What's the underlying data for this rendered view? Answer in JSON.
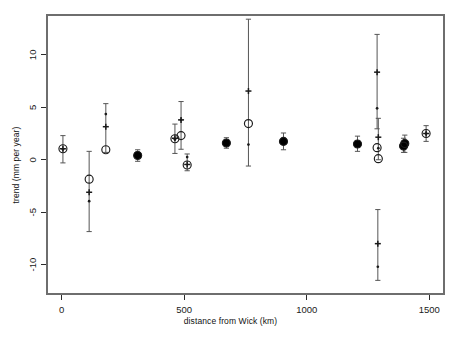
{
  "chart_data": {
    "type": "scatter",
    "title": "",
    "subtitle": "",
    "xlabel": "distance from Wick (km)",
    "ylabel": "trend (mm per year)",
    "xlim": [
      -60,
      1560
    ],
    "ylim": [
      -12.8,
      13.8
    ],
    "xticks": [
      0,
      500,
      1000,
      1500
    ],
    "xticklabels": [
      "0",
      "500",
      "1000",
      "1500"
    ],
    "yticks": [
      -10,
      -5,
      0,
      5,
      10
    ],
    "yticklabels": [
      "-10",
      "-5",
      "0",
      "5",
      "10"
    ],
    "grid": false,
    "legend": false,
    "legend_position": "none",
    "box": true,
    "colors": {
      "foreground": "#1a1a1a",
      "frame": "#6e6e6e",
      "open_circle": "#1a1a1a",
      "filled_circle": "#000000",
      "error_bar": "#555555"
    },
    "series": [
      {
        "name": "open-circle",
        "marker": "open-circle",
        "points": [
          {
            "x": 5,
            "y": 1.05
          },
          {
            "x": 112,
            "y": -1.85
          },
          {
            "x": 180,
            "y": 0.95
          },
          {
            "x": 310,
            "y": 0.4
          },
          {
            "x": 462,
            "y": 2.0
          },
          {
            "x": 487,
            "y": 2.3
          },
          {
            "x": 512,
            "y": -0.5
          },
          {
            "x": 672,
            "y": 1.6
          },
          {
            "x": 762,
            "y": 3.45
          },
          {
            "x": 905,
            "y": 1.75
          },
          {
            "x": 1207,
            "y": 1.5
          },
          {
            "x": 1287,
            "y": 1.15
          },
          {
            "x": 1292,
            "y": 0.1
          },
          {
            "x": 1395,
            "y": 1.3
          },
          {
            "x": 1400,
            "y": 1.55
          },
          {
            "x": 1487,
            "y": 2.5
          }
        ]
      },
      {
        "name": "cross",
        "marker": "plus",
        "points": [
          {
            "x": 5,
            "y": 1.05
          },
          {
            "x": 112,
            "y": -3.1
          },
          {
            "x": 180,
            "y": 3.15
          },
          {
            "x": 310,
            "y": 0.45
          },
          {
            "x": 462,
            "y": 2.05
          },
          {
            "x": 487,
            "y": 3.8
          },
          {
            "x": 512,
            "y": -0.45
          },
          {
            "x": 672,
            "y": 1.6
          },
          {
            "x": 762,
            "y": 6.55
          },
          {
            "x": 905,
            "y": 1.75
          },
          {
            "x": 1207,
            "y": 1.5
          },
          {
            "x": 1287,
            "y": 8.35
          },
          {
            "x": 1292,
            "y": 2.15
          },
          {
            "x": 1290,
            "y": -8.0
          },
          {
            "x": 1395,
            "y": 1.35
          },
          {
            "x": 1400,
            "y": 1.6
          },
          {
            "x": 1487,
            "y": 2.5
          }
        ]
      },
      {
        "name": "small-dot",
        "marker": "point",
        "points": [
          {
            "x": 5,
            "y": 1.0
          },
          {
            "x": 112,
            "y": -3.95
          },
          {
            "x": 180,
            "y": 4.35
          },
          {
            "x": 310,
            "y": 0.4
          },
          {
            "x": 462,
            "y": 1.95
          },
          {
            "x": 487,
            "y": 3.8
          },
          {
            "x": 512,
            "y": 0.25
          },
          {
            "x": 672,
            "y": 1.6
          },
          {
            "x": 762,
            "y": 1.45
          },
          {
            "x": 905,
            "y": 1.75
          },
          {
            "x": 1207,
            "y": 1.5
          },
          {
            "x": 1287,
            "y": 4.9
          },
          {
            "x": 1292,
            "y": 1.1
          },
          {
            "x": 1290,
            "y": -10.2
          },
          {
            "x": 1395,
            "y": 1.25
          },
          {
            "x": 1400,
            "y": 1.55
          },
          {
            "x": 1487,
            "y": 2.5
          }
        ]
      }
    ],
    "error_bars": [
      {
        "x": 5,
        "center": 1.05,
        "low": -0.3,
        "high": 2.3
      },
      {
        "x": 112,
        "center": -1.85,
        "low": -6.85,
        "high": 0.8
      },
      {
        "x": 180,
        "center": 2.6,
        "low": 0.7,
        "high": 5.35
      },
      {
        "x": 310,
        "center": 0.4,
        "low": -0.15,
        "high": 0.95
      },
      {
        "x": 462,
        "center": 2.0,
        "low": 0.6,
        "high": 3.4
      },
      {
        "x": 487,
        "center": 3.3,
        "low": 1.0,
        "high": 5.55
      },
      {
        "x": 512,
        "center": -0.3,
        "low": -1.05,
        "high": 0.55
      },
      {
        "x": 672,
        "center": 1.6,
        "low": 1.1,
        "high": 2.1
      },
      {
        "x": 762,
        "center": 5.0,
        "low": -0.6,
        "high": 13.4
      },
      {
        "x": 905,
        "center": 1.75,
        "low": 0.95,
        "high": 2.55
      },
      {
        "x": 1207,
        "center": 1.5,
        "low": 0.8,
        "high": 2.25
      },
      {
        "x": 1287,
        "center": 8.35,
        "low": 2.95,
        "high": 11.95
      },
      {
        "x": 1292,
        "center": 1.55,
        "low": 0.0,
        "high": 3.95
      },
      {
        "x": 1290,
        "center": -8.0,
        "low": -11.5,
        "high": -4.75
      },
      {
        "x": 1395,
        "center": 1.3,
        "low": 0.7,
        "high": 2.05
      },
      {
        "x": 1400,
        "center": 1.55,
        "low": 0.7,
        "high": 2.35
      },
      {
        "x": 1487,
        "center": 2.5,
        "low": 1.75,
        "high": 3.25
      }
    ],
    "filled_markers": [
      {
        "x": 310,
        "y": 0.42
      },
      {
        "x": 672,
        "y": 1.6
      },
      {
        "x": 905,
        "y": 1.75
      },
      {
        "x": 1207,
        "y": 1.5
      },
      {
        "x": 1395,
        "y": 1.3
      },
      {
        "x": 1400,
        "y": 1.55
      }
    ]
  }
}
